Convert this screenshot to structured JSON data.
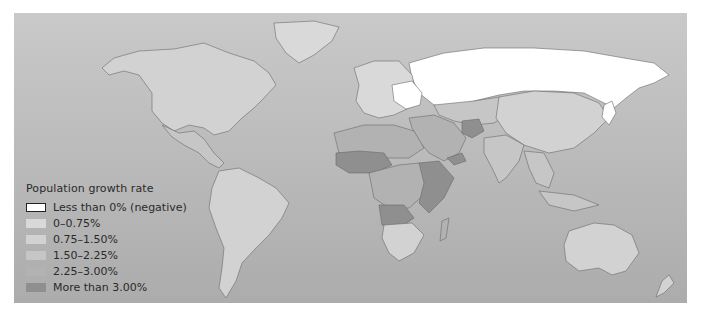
{
  "map": {
    "title": "Population growth rate",
    "background_color": "#bdbdbd",
    "legend": [
      {
        "label": "Less than 0% (negative)",
        "color": "#ffffff",
        "border": "#222222"
      },
      {
        "label": "0–0.75%",
        "color": "#d9d9d9"
      },
      {
        "label": "0.75–1.50%",
        "color": "#d2d2d2"
      },
      {
        "label": "1.50–2.25%",
        "color": "#c6c6c6"
      },
      {
        "label": "2.25–3.00%",
        "color": "#b2b2b2"
      },
      {
        "label": "More than 3.00%",
        "color": "#8f8f8f"
      }
    ],
    "regions": [
      {
        "name": "north-america",
        "class_index": 2
      },
      {
        "name": "greenland",
        "class_index": 1
      },
      {
        "name": "mexico-central-america",
        "class_index": 3
      },
      {
        "name": "south-america",
        "class_index": 2
      },
      {
        "name": "russia",
        "class_index": 0
      },
      {
        "name": "europe",
        "class_index": 1
      },
      {
        "name": "eastern-europe",
        "class_index": 0
      },
      {
        "name": "central-asia",
        "class_index": 3
      },
      {
        "name": "middle-east",
        "class_index": 4
      },
      {
        "name": "afghanistan",
        "class_index": 5
      },
      {
        "name": "china-mongolia",
        "class_index": 2
      },
      {
        "name": "india",
        "class_index": 3
      },
      {
        "name": "southeast-asia",
        "class_index": 3
      },
      {
        "name": "japan",
        "class_index": 0
      },
      {
        "name": "north-africa",
        "class_index": 4
      },
      {
        "name": "sahel",
        "class_index": 5
      },
      {
        "name": "central-africa",
        "class_index": 4
      },
      {
        "name": "east-africa",
        "class_index": 5
      },
      {
        "name": "angola",
        "class_index": 5
      },
      {
        "name": "southern-africa",
        "class_index": 2
      },
      {
        "name": "madagascar",
        "class_index": 4
      },
      {
        "name": "yemen",
        "class_index": 5
      },
      {
        "name": "australia",
        "class_index": 2
      },
      {
        "name": "new-zealand",
        "class_index": 2
      },
      {
        "name": "indonesia",
        "class_index": 3
      }
    ]
  }
}
